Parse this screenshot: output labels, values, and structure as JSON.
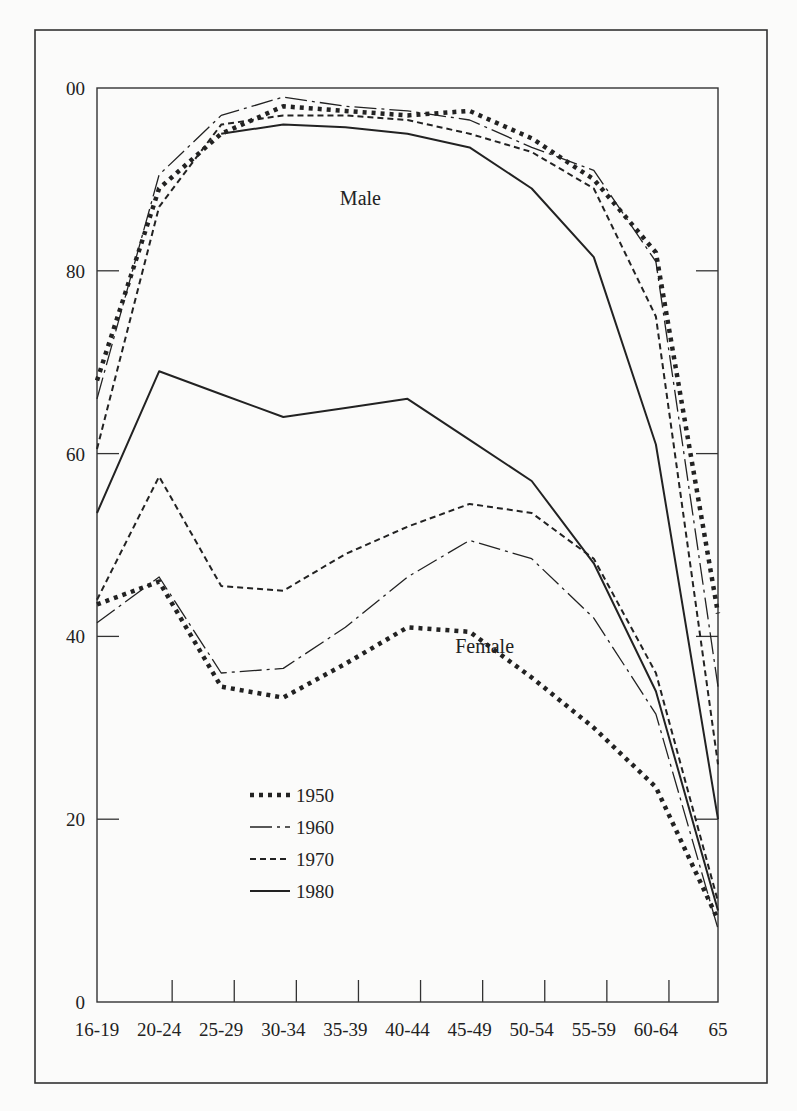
{
  "chart_data": {
    "type": "line",
    "title": "",
    "xlabel": "",
    "ylabel": "",
    "categories": [
      "16-19",
      "20-24",
      "25-29",
      "30-34",
      "35-39",
      "40-44",
      "45-49",
      "50-54",
      "55-59",
      "60-64",
      "65"
    ],
    "y_ticks": [
      0,
      20,
      40,
      60,
      80,
      100
    ],
    "y_tick_labels": [
      "0",
      "20",
      "40",
      "60",
      "80",
      "00"
    ],
    "ylim": [
      0,
      100
    ],
    "grid": false,
    "legend_position": "lower-left",
    "annotations": [
      {
        "text": "Male",
        "x": "35-39",
        "y": 88
      },
      {
        "text": "Female",
        "x": "45-49",
        "y": 39
      }
    ],
    "series": [
      {
        "name": "1950",
        "group": "Male",
        "style": "dotted-heavy",
        "values": [
          68,
          89,
          95,
          98,
          97.5,
          97,
          97.5,
          94.5,
          90,
          82,
          42.5
        ]
      },
      {
        "name": "1960",
        "group": "Male",
        "style": "dash-dot",
        "values": [
          66,
          90.5,
          97,
          99,
          98,
          97.5,
          96.5,
          93.5,
          91,
          81,
          34.5
        ]
      },
      {
        "name": "1970",
        "group": "Male",
        "style": "dashed",
        "values": [
          60.5,
          87,
          96,
          97,
          97,
          96.5,
          95,
          93,
          89,
          75,
          26
        ]
      },
      {
        "name": "1980",
        "group": "Male",
        "style": "solid",
        "values": [
          null,
          null,
          95,
          96,
          95.7,
          95,
          93.5,
          89,
          81.5,
          61,
          20
        ]
      },
      {
        "name": "1950",
        "group": "Female",
        "style": "dotted-heavy",
        "values": [
          43.5,
          46,
          34.5,
          33.3,
          37,
          41,
          40.5,
          35.5,
          30,
          23.5,
          9
        ]
      },
      {
        "name": "1960",
        "group": "Female",
        "style": "dash-dot",
        "values": [
          41.5,
          46.5,
          36,
          36.5,
          41,
          46.5,
          50.5,
          48.5,
          42,
          31.5,
          8
        ]
      },
      {
        "name": "1970",
        "group": "Female",
        "style": "dashed",
        "values": [
          44,
          57.5,
          45.5,
          45,
          49,
          52,
          54.5,
          53.5,
          48.5,
          36,
          11
        ]
      },
      {
        "name": "1980",
        "group": "Female",
        "style": "solid",
        "values": [
          53.5,
          69,
          66.5,
          64,
          65,
          66,
          61.5,
          57,
          48,
          34,
          10
        ]
      }
    ],
    "legend": [
      {
        "label": "1950",
        "style": "dotted-heavy"
      },
      {
        "label": "1960",
        "style": "dash-dot"
      },
      {
        "label": "1970",
        "style": "dashed"
      },
      {
        "label": "1980",
        "style": "solid"
      }
    ]
  },
  "colors": {
    "ink": "#222222",
    "background": "#fbfbfa"
  }
}
